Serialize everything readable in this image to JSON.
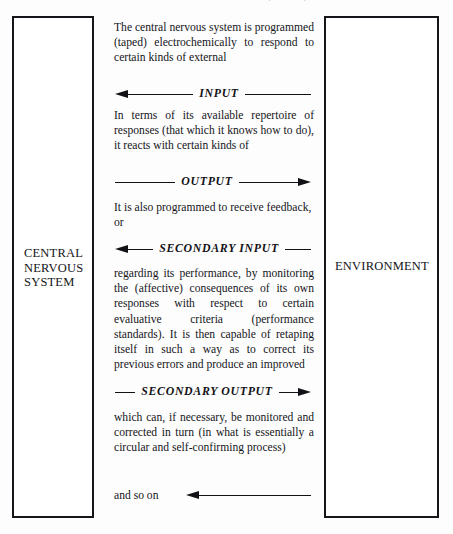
{
  "page": {
    "running_header": "THE CNS AS A SELF-CORRECTING (TAPED) SYSTEM",
    "width": 453,
    "height": 534,
    "ink_color": "#121216",
    "paper_color": "#fdfdfd"
  },
  "left_box": {
    "label": "CENTRAL\nNERVOUS\nSYSTEM"
  },
  "right_box": {
    "label": "ENVIRONMENT"
  },
  "flow": {
    "paragraph_1": "The central nervous system is programmed (taped) electrochemically to respond to certain kinds of external",
    "arrow_1_label": "INPUT",
    "arrow_1_direction": "left",
    "paragraph_2": "In terms of its available repertoire of responses (that which it knows how to do), it reacts with certain kinds of",
    "arrow_2_label": "OUTPUT",
    "arrow_2_direction": "right",
    "paragraph_3": "It is also programmed to receive feedback, or",
    "arrow_3_label": "SECONDARY INPUT",
    "arrow_3_direction": "left",
    "paragraph_4": "regarding its performance, by monitoring the (affective) consequences of its own responses with respect to certain evaluative criteria (performance standards). It is then capable of retaping itself in such a way as to correct its previous errors and produce an improved",
    "arrow_4_label": "SECONDARY OUTPUT",
    "arrow_4_direction": "right",
    "paragraph_5": "which can, if necessary, be monitored and corrected in turn (in what is essentially a circular and self-confirming process)",
    "closing_text": "and so on",
    "arrow_5_label": "",
    "arrow_5_direction": "left"
  }
}
